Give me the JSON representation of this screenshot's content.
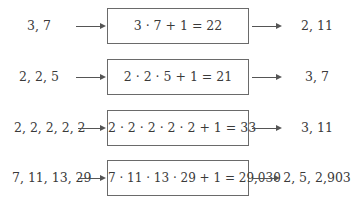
{
  "diagram": {
    "title": "",
    "rows": [
      {
        "input": "3, 7",
        "computation": "3 · 7 + 1 = 22",
        "output": "2, 11"
      },
      {
        "input": "2, 2, 5",
        "computation": "2 · 2 · 5 + 1 = 21",
        "output": "3, 7"
      },
      {
        "input": "2, 2, 2, 2, 2",
        "computation": "2 · 2 · 2 · 2 · 2 + 1 = 33",
        "output": "3, 11"
      },
      {
        "input": "7, 11, 13, 29",
        "computation": "7 · 11 · 13 · 29 + 1 = 29,030",
        "output": "2, 5, 2,903"
      }
    ],
    "colors": {
      "text": "#3a3a3a",
      "box_border": "#6a6a6a",
      "arrow": "#555555",
      "background": "#ffffff"
    }
  }
}
